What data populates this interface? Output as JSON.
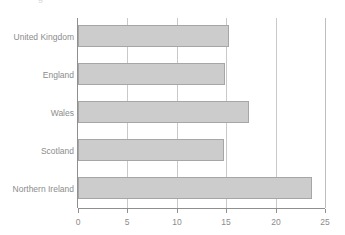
{
  "chart_data": {
    "type": "bar",
    "orientation": "horizontal",
    "title": "",
    "xlabel": "",
    "ylabel": "",
    "categories": [
      "United Kingdom",
      "England",
      "Wales",
      "Scotland",
      "Northern Ireland"
    ],
    "values": [
      15.3,
      14.9,
      17.3,
      14.8,
      23.7
    ],
    "xlim": [
      0,
      25
    ],
    "xticks": [
      0,
      5,
      10,
      15,
      20,
      25
    ],
    "xtick_labels": [
      "0",
      "5",
      "10",
      "15",
      "20",
      "25"
    ],
    "grid": "vertical",
    "legend": "none",
    "series": [
      {
        "name": "",
        "values": [
          15.3,
          14.9,
          17.3,
          14.8,
          23.7
        ]
      }
    ]
  },
  "style": {
    "bar_fill": "#cccccc",
    "bar_border": "#a6a6a6",
    "gridline_color": "#c9c9c9",
    "axis_color": "#8f8f8f",
    "text_color": "#8c8c8c",
    "background": "#ffffff"
  },
  "title_remnant": "g"
}
